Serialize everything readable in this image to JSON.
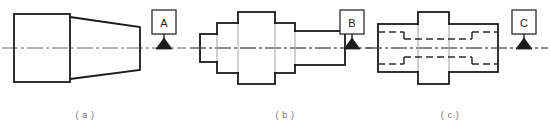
{
  "figure": {
    "kind": "engineering-drawing",
    "background_color": "#ffffff",
    "line_color": "#1a1a1a",
    "centerline_color": "#555555",
    "hidden_line_color": "#2b2b2b",
    "caption_color": "#6e6e6e",
    "width": 550,
    "height": 137
  },
  "parts": [
    {
      "id": "a",
      "caption": "( a )",
      "description": "stepped cylinder with tapered cone section",
      "datum": {
        "letter": "A",
        "frame": {
          "x": 152,
          "y": 10,
          "w": 24,
          "h": 24
        },
        "leader": {
          "x": 164,
          "y_top": 34,
          "y_bottom": 48
        },
        "triangle": {
          "cx": 164,
          "base_y": 49,
          "half_width": 8,
          "height": 11
        }
      },
      "centerline": {
        "x1": 2,
        "x2": 186,
        "y": 48
      },
      "outline": {
        "rect": {
          "x": 14,
          "y": 14,
          "w": 56,
          "h": 68
        },
        "cone": {
          "x_left": 70,
          "x_right": 140,
          "y_top_left": 17,
          "y_bottom_left": 79,
          "y_top_right": 27,
          "y_bottom_right": 70
        }
      }
    },
    {
      "id": "b",
      "caption": "( b )",
      "description": "five-section stepped shaft, symmetric about axis",
      "datum": {
        "letter": "B",
        "frame": {
          "x": 340,
          "y": 10,
          "w": 24,
          "h": 24
        },
        "leader": {
          "x": 352,
          "y_top": 34,
          "y_bottom": 48
        },
        "triangle": {
          "cx": 352,
          "base_y": 49,
          "half_width": 8,
          "height": 11
        }
      },
      "centerline": {
        "x1": 190,
        "x2": 372,
        "y": 48
      },
      "steps": [
        {
          "x": 200,
          "w": 17,
          "half_height": 14
        },
        {
          "x": 217,
          "w": 21,
          "half_height": 25
        },
        {
          "x": 238,
          "w": 37,
          "half_height": 36
        },
        {
          "x": 275,
          "w": 20,
          "half_height": 25
        },
        {
          "x": 295,
          "w": 50,
          "half_height": 17
        }
      ]
    },
    {
      "id": "c",
      "caption": "( c )",
      "description": "bored stepped sleeve with hidden counterbores shown as dashed lines",
      "datum": {
        "letter": "C",
        "frame": {
          "x": 512,
          "y": 10,
          "w": 24,
          "h": 24
        },
        "leader": {
          "x": 524,
          "y_top": 34,
          "y_bottom": 48
        },
        "triangle": {
          "cx": 524,
          "base_y": 49,
          "half_width": 8,
          "height": 11
        }
      },
      "centerline": {
        "x1": 366,
        "x2": 548,
        "y": 48
      },
      "steps": [
        {
          "x": 378,
          "w": 40,
          "half_height": 24
        },
        {
          "x": 418,
          "w": 31,
          "half_height": 36
        },
        {
          "x": 449,
          "w": 49,
          "half_height": 24
        }
      ],
      "hidden_bores": [
        {
          "name": "left-counterbore",
          "x_start": 378,
          "x_end": 404,
          "half_height": 16
        },
        {
          "name": "through-bore",
          "x_start": 404,
          "x_end": 472,
          "half_height": 9
        },
        {
          "name": "right-counterbore",
          "x_start": 472,
          "x_end": 498,
          "half_height": 16
        }
      ]
    }
  ]
}
